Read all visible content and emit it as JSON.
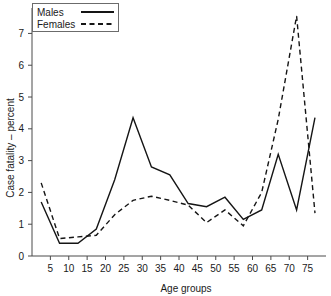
{
  "chart_data": {
    "type": "line",
    "title": "",
    "xlabel": "Age groups",
    "ylabel": "Case fatality – percent",
    "xlim": [
      0,
      80
    ],
    "ylim": [
      0,
      7.8
    ],
    "xticks": [
      5,
      10,
      15,
      20,
      25,
      30,
      35,
      40,
      45,
      50,
      55,
      60,
      65,
      70,
      75
    ],
    "yticks": [
      0,
      1,
      2,
      3,
      4,
      5,
      6,
      7
    ],
    "grid": false,
    "legend_position": "top-left",
    "x": [
      2.5,
      7.5,
      12.5,
      17.5,
      22.5,
      27.5,
      32.5,
      37.5,
      42.5,
      47.5,
      52.5,
      57.5,
      62.5,
      67.0,
      72.0,
      77.0
    ],
    "series": [
      {
        "name": "Males",
        "style": "solid",
        "values": [
          1.7,
          0.4,
          0.4,
          0.85,
          2.4,
          4.35,
          2.8,
          2.55,
          1.65,
          1.55,
          1.85,
          1.15,
          1.45,
          3.2,
          1.45,
          4.35
        ]
      },
      {
        "name": "Females",
        "style": "dashed",
        "values": [
          2.3,
          0.55,
          0.6,
          0.65,
          1.3,
          1.75,
          1.88,
          1.75,
          1.6,
          1.05,
          1.45,
          0.95,
          2.0,
          4.3,
          7.55,
          1.35
        ]
      }
    ]
  },
  "legend": {
    "items": [
      {
        "label": "Males",
        "style": "solid"
      },
      {
        "label": "Females",
        "style": "dashed"
      }
    ]
  },
  "axes": {
    "x_title": "Age groups",
    "y_title": "Case fatality – percent",
    "x_tick_labels": [
      "5",
      "10",
      "15",
      "20",
      "25",
      "30",
      "35",
      "40",
      "45",
      "50",
      "55",
      "60",
      "65",
      "70",
      "75"
    ],
    "y_tick_labels": [
      "0",
      "1",
      "2",
      "3",
      "4",
      "5",
      "6",
      "7"
    ]
  },
  "colors": {
    "background": "#ffffff",
    "line": "#151515",
    "axis": "#4a4a4a",
    "text": "#1a1a1a"
  }
}
